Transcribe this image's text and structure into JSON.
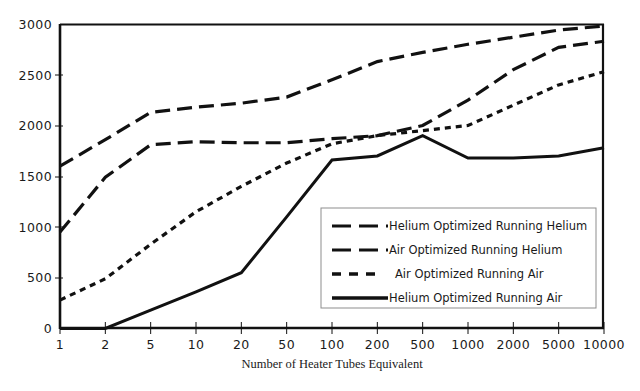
{
  "chart_data": {
    "type": "line",
    "title": "",
    "xlabel": "Number of Heater Tubes Equivalent",
    "ylabel": "",
    "categories": [
      "1",
      "2",
      "5",
      "10",
      "20",
      "50",
      "100",
      "200",
      "500",
      "1000",
      "2000",
      "5000",
      "10000"
    ],
    "x_scale": "log-categorical",
    "ylim": [
      0,
      3000
    ],
    "y_ticks": [
      "0",
      "500",
      "1000",
      "1500",
      "2000",
      "2500",
      "3000"
    ],
    "grid": false,
    "legend_position": "inside-lower-right",
    "series": [
      {
        "name": "Helium Optimized Running Helium",
        "style": "long-dash",
        "values": [
          1600,
          1860,
          2130,
          2180,
          2220,
          2280,
          2450,
          2630,
          2720,
          2800,
          2870,
          2940,
          2980
        ]
      },
      {
        "name": "Air Optimized Running Helium",
        "style": "long-dash",
        "values": [
          950,
          1490,
          1810,
          1840,
          1830,
          1830,
          1870,
          1900,
          2000,
          2250,
          2550,
          2770,
          2830
        ]
      },
      {
        "name": "Air Optimized Running Air",
        "style": "short-dash",
        "values": [
          280,
          490,
          830,
          1150,
          1400,
          1630,
          1820,
          1900,
          1950,
          2000,
          2200,
          2400,
          2530
        ]
      },
      {
        "name": "Helium Optimized Running Air",
        "style": "solid",
        "values": [
          0,
          0,
          180,
          360,
          550,
          1100,
          1660,
          1700,
          1900,
          1680,
          1680,
          1700,
          1780
        ]
      }
    ],
    "colors": {
      "ink": "#111111",
      "background": "#ffffff",
      "legend_border": "#8d8d8d"
    }
  },
  "legend": {
    "entries": [
      {
        "label": "Helium Optimized Running Helium",
        "style": "long-dash"
      },
      {
        "label": "Air Optimized Running Helium",
        "style": "long-dash"
      },
      {
        "label": "Air Optimized Running Air",
        "style": "short-dash"
      },
      {
        "label": "Helium Optimized Running Air",
        "style": "solid"
      }
    ]
  }
}
